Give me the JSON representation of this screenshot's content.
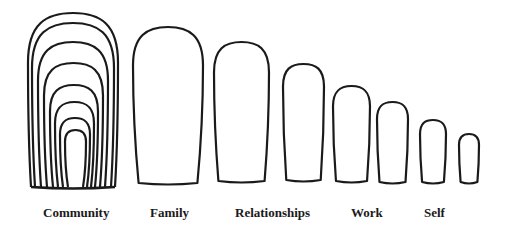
{
  "diagram": {
    "stroke_color": "#1a1a1a",
    "background": "#ffffff",
    "community": {
      "label": "Community",
      "arches": [
        {
          "x1": 28,
          "x2": 118,
          "top": 13
        },
        {
          "x1": 32,
          "x2": 114,
          "top": 23
        },
        {
          "x1": 38,
          "x2": 108,
          "top": 42
        },
        {
          "x1": 44,
          "x2": 103,
          "top": 63
        },
        {
          "x1": 50,
          "x2": 98,
          "top": 85
        },
        {
          "x1": 55,
          "x2": 94,
          "top": 102
        },
        {
          "x1": 60,
          "x2": 90,
          "top": 118
        },
        {
          "x1": 65,
          "x2": 86,
          "top": 130
        }
      ],
      "bottom": 187
    },
    "shapes": [
      {
        "name": "family",
        "x1": 133,
        "x2": 203,
        "top": 27,
        "bottom": 183
      },
      {
        "name": "relationships",
        "x1": 214,
        "x2": 269,
        "top": 42,
        "bottom": 181
      },
      {
        "name": "shape-4",
        "x1": 283,
        "x2": 324,
        "top": 64,
        "bottom": 180
      },
      {
        "name": "work",
        "x1": 333,
        "x2": 370,
        "top": 86,
        "bottom": 181
      },
      {
        "name": "shape-6",
        "x1": 377,
        "x2": 408,
        "top": 102,
        "bottom": 182
      },
      {
        "name": "self",
        "x1": 420,
        "x2": 446,
        "top": 120,
        "bottom": 182
      },
      {
        "name": "shape-8",
        "x1": 459,
        "x2": 479,
        "top": 134,
        "bottom": 182
      }
    ],
    "labels": [
      {
        "text": "Community",
        "x": 43
      },
      {
        "text": "Family",
        "x": 150
      },
      {
        "text": "Relationships",
        "x": 235
      },
      {
        "text": "Work",
        "x": 351
      },
      {
        "text": "Self",
        "x": 424
      }
    ]
  }
}
